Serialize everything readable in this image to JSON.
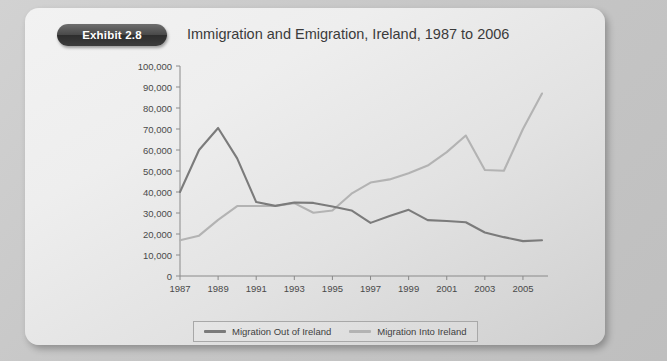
{
  "exhibit": {
    "badge": "Exhibit 2.8"
  },
  "header": {
    "title": "Immigration and Emigration, Ireland, 1987 to 2006"
  },
  "colors": {
    "series_out": "#7b7b7b",
    "series_into": "#b3b3b3",
    "axis": "#8a8a8a",
    "badge_bg": "#3c3c3c",
    "card_bg": "#ededed",
    "page_bg": "#c9c9c9"
  },
  "legend": {
    "position": "bottom",
    "items": [
      {
        "label": "Migration Out of Ireland",
        "color": "#7b7b7b"
      },
      {
        "label": "Migration Into Ireland",
        "color": "#b3b3b3"
      }
    ]
  },
  "axes": {
    "y_tick_labels": [
      "100,000",
      "90,000",
      "80,000",
      "70,000",
      "60,000",
      "50,000",
      "40,000",
      "30,000",
      "20,000",
      "10,000",
      "0"
    ],
    "x_tick_labels": [
      "1987",
      "1989",
      "1991",
      "1993",
      "1995",
      "1997",
      "1999",
      "2001",
      "2003",
      "2005"
    ]
  },
  "chart_data": {
    "type": "line",
    "title": "Immigration and Emigration, Ireland, 1987 to 2006",
    "xlabel": "",
    "ylabel": "",
    "ylim": [
      0,
      100000
    ],
    "ytick_step": 10000,
    "grid": false,
    "legend_position": "bottom",
    "x": [
      1987,
      1988,
      1989,
      1990,
      1991,
      1992,
      1993,
      1994,
      1995,
      1996,
      1997,
      1998,
      1999,
      2000,
      2001,
      2002,
      2003,
      2004,
      2005,
      2006
    ],
    "x_tick_every": 2,
    "series": [
      {
        "name": "Migration Out of Ireland",
        "color": "#7b7b7b",
        "values": [
          40000,
          60000,
          70500,
          56000,
          35200,
          33400,
          35000,
          34800,
          33100,
          31200,
          25300,
          28600,
          31500,
          26600,
          26200,
          25600,
          20700,
          18500,
          16600,
          17000
        ]
      },
      {
        "name": "Migration Into Ireland",
        "color": "#b3b3b3",
        "values": [
          17000,
          19200,
          26700,
          33300,
          33300,
          33300,
          34700,
          30100,
          31200,
          39200,
          44500,
          46000,
          48900,
          52600,
          59000,
          66900,
          50500,
          50100,
          70000,
          86900
        ]
      }
    ]
  }
}
